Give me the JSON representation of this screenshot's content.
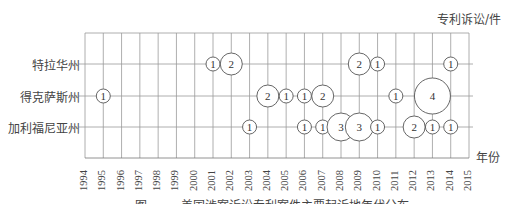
{
  "chart_data": {
    "type": "bubble",
    "title": "",
    "ylabel": "专利诉讼/件",
    "xlabel": "年份",
    "x": [
      1994,
      1995,
      1996,
      1997,
      1998,
      1999,
      2000,
      2001,
      2002,
      2003,
      2004,
      2005,
      2006,
      2007,
      2008,
      2009,
      2010,
      2011,
      2012,
      2013,
      2014,
      2015
    ],
    "categories": [
      "特拉华州",
      "得克萨斯州",
      "加利福尼亚州"
    ],
    "series": [
      {
        "name": "特拉华州",
        "points": [
          {
            "year": 2001,
            "value": 1
          },
          {
            "year": 2002,
            "value": 2
          },
          {
            "year": 2009,
            "value": 2
          },
          {
            "year": 2010,
            "value": 1
          },
          {
            "year": 2014,
            "value": 1
          }
        ]
      },
      {
        "name": "得克萨斯州",
        "points": [
          {
            "year": 1995,
            "value": 1
          },
          {
            "year": 2004,
            "value": 2
          },
          {
            "year": 2005,
            "value": 1
          },
          {
            "year": 2006,
            "value": 1
          },
          {
            "year": 2007,
            "value": 2
          },
          {
            "year": 2011,
            "value": 1
          },
          {
            "year": 2013,
            "value": 4
          }
        ]
      },
      {
        "name": "加利福尼亚州",
        "points": [
          {
            "year": 2003,
            "value": 1
          },
          {
            "year": 2006,
            "value": 1
          },
          {
            "year": 2007,
            "value": 1
          },
          {
            "year": 2008,
            "value": 3
          },
          {
            "year": 2009,
            "value": 3
          },
          {
            "year": 2010,
            "value": 1
          },
          {
            "year": 2012,
            "value": 2
          },
          {
            "year": 2013,
            "value": 1
          },
          {
            "year": 2014,
            "value": 1
          }
        ]
      }
    ],
    "xlim": [
      1994,
      2015
    ],
    "grid": true,
    "legend": "none"
  },
  "labels": {
    "unit": "专利诉讼/件",
    "x_axis_title": "年份",
    "caption": "图 · · · · 美国涉案诉讼专利案件主要起诉地年代分布"
  }
}
